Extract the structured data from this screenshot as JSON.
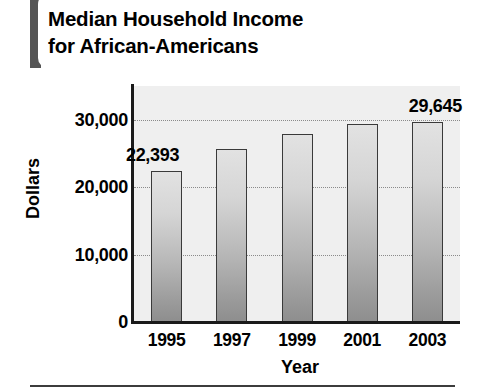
{
  "chart_data": {
    "type": "bar",
    "title": "Median Household Income\nfor African-Americans",
    "title_line1": "Median Household Income",
    "title_line2": "for African-Americans",
    "xlabel": "Year",
    "ylabel": "Dollars",
    "categories": [
      "1995",
      "1997",
      "1999",
      "2001",
      "2003"
    ],
    "values": [
      22393,
      25700,
      27900,
      29400,
      29645
    ],
    "point_labels": [
      "22,393",
      "",
      "",
      "",
      "29,645"
    ],
    "ytick_labels": [
      "0",
      "10,000",
      "20,000",
      "30,000"
    ],
    "ytick_values": [
      0,
      10000,
      20000,
      30000
    ],
    "ylim": [
      0,
      35000
    ],
    "grid": "horizontal-dotted",
    "legend": "none",
    "bar_fill": "#c8c8c8",
    "bar_border": "#3a3a3a",
    "plot_background": "#efefef",
    "accent_color": "#555555"
  },
  "axis": {
    "y_title": "Dollars",
    "x_title": "Year"
  }
}
